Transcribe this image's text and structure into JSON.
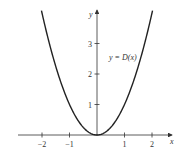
{
  "chart_data": {
    "type": "line",
    "title": "",
    "xlabel": "x",
    "ylabel": "y",
    "xlim": [
      -2.5,
      2.5
    ],
    "ylim": [
      0,
      4.2
    ],
    "x_ticks": [
      -2,
      -1,
      1,
      2
    ],
    "x_tick_labels": [
      "−2",
      "−1",
      "1",
      "2"
    ],
    "y_ticks": [
      1,
      2,
      3
    ],
    "y_tick_labels": [
      "1",
      "2",
      "3"
    ],
    "grid": false,
    "legend": null,
    "annotations": [
      {
        "text": "y = D(x)",
        "x": 0.9,
        "y": 2.8
      }
    ],
    "series": [
      {
        "name": "y = D(x)",
        "function": "x^2",
        "x": [
          -2,
          -1.5,
          -1,
          -0.5,
          0,
          0.5,
          1,
          1.5,
          2
        ],
        "y": [
          4,
          2.25,
          1,
          0.25,
          0,
          0.25,
          1,
          2.25,
          4
        ]
      }
    ]
  }
}
